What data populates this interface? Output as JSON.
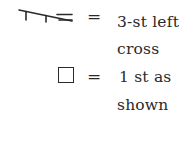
{
  "legend": {
    "items": [
      {
        "symbol": "3-st-left-cross-symbol",
        "equals": "=",
        "line1": "3-st left",
        "line2": "cross"
      },
      {
        "symbol": "stitch-square-symbol",
        "equals": "=",
        "line1": "1 st as",
        "line2": "shown"
      }
    ]
  }
}
